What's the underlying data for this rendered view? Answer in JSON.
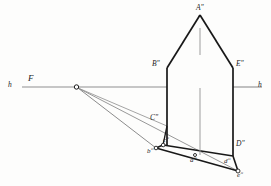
{
  "figure": {
    "type": "descriptive-geometry-perspective-construction",
    "background_color": "#fdfdfc",
    "line_color_main": "#1a1a1a",
    "line_color_aux": "#8a8a8a",
    "labels": {
      "horizon_left": "h",
      "horizon_right": "h",
      "vanishing_point": "F",
      "apex": "Aʺ",
      "left_eave": "Bʺ",
      "right_eave": "Eʺ",
      "left_base_upper": "Cʺ",
      "right_base_upper": "Dʺ",
      "base_b": "bʺ",
      "base_c": "cʺ",
      "base_a": "aʺ",
      "base_d": "dʺ",
      "base_e": "eʺ"
    },
    "points": {
      "F": [
        76,
        87
      ],
      "h_left_end": [
        22,
        87
      ],
      "h_right_end": [
        262,
        87
      ],
      "A": [
        200,
        14
      ],
      "B": [
        167,
        68
      ],
      "E": [
        233,
        68
      ],
      "C": [
        167,
        126
      ],
      "D": [
        233,
        144
      ],
      "b": [
        156,
        148
      ],
      "c": [
        163,
        145
      ],
      "a": [
        195,
        155
      ],
      "d": [
        229,
        158
      ],
      "e": [
        238,
        171
      ]
    }
  }
}
